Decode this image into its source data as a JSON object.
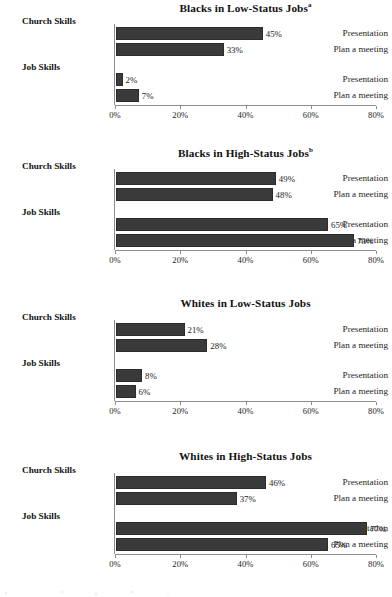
{
  "chart_data": [
    {
      "type": "bar",
      "orientation": "horizontal",
      "title": "Blacks in Low-Status Jobs",
      "title_superscript": "a",
      "xlabel": "",
      "ylabel": "",
      "xlim": [
        0,
        80
      ],
      "grid": false,
      "legend": "none",
      "tick_labels": [
        "0%",
        "20%",
        "40%",
        "60%",
        "80%"
      ],
      "tick_values": [
        0,
        20,
        40,
        60,
        80
      ],
      "groups": [
        {
          "name": "Church Skills",
          "categories": [
            "Presentation",
            "Plan a meeting"
          ],
          "values": [
            45,
            33
          ],
          "value_labels": [
            "45%",
            "33%"
          ]
        },
        {
          "name": "Job Skills",
          "categories": [
            "Presentation",
            "Plan a meeting"
          ],
          "values": [
            2,
            7
          ],
          "value_labels": [
            "2%",
            "7%"
          ]
        }
      ]
    },
    {
      "type": "bar",
      "orientation": "horizontal",
      "title": "Blacks in High-Status Jobs",
      "title_superscript": "b",
      "xlabel": "",
      "ylabel": "",
      "xlim": [
        0,
        80
      ],
      "grid": false,
      "legend": "none",
      "tick_labels": [
        "0%",
        "20%",
        "40%",
        "60%",
        "80%"
      ],
      "tick_values": [
        0,
        20,
        40,
        60,
        80
      ],
      "groups": [
        {
          "name": "Church Skills",
          "categories": [
            "Presentation",
            "Plan a meeting"
          ],
          "values": [
            49,
            48
          ],
          "value_labels": [
            "49%",
            "48%"
          ]
        },
        {
          "name": "Job Skills",
          "categories": [
            "Presentation",
            "Plan a meeting"
          ],
          "values": [
            65,
            73
          ],
          "value_labels": [
            "65%",
            "73%"
          ]
        }
      ]
    },
    {
      "type": "bar",
      "orientation": "horizontal",
      "title": "Whites in Low-Status Jobs",
      "title_superscript": "",
      "xlabel": "",
      "ylabel": "",
      "xlim": [
        0,
        80
      ],
      "grid": false,
      "legend": "none",
      "tick_labels": [
        "0%",
        "20%",
        "40%",
        "60%",
        "80%"
      ],
      "tick_values": [
        0,
        20,
        40,
        60,
        80
      ],
      "groups": [
        {
          "name": "Church Skills",
          "categories": [
            "Presentation",
            "Plan a meeting"
          ],
          "values": [
            21,
            28
          ],
          "value_labels": [
            "21%",
            "28%"
          ]
        },
        {
          "name": "Job Skills",
          "categories": [
            "Presentation",
            "Plan a meeting"
          ],
          "values": [
            8,
            6
          ],
          "value_labels": [
            "8%",
            "6%"
          ]
        }
      ]
    },
    {
      "type": "bar",
      "orientation": "horizontal",
      "title": "Whites in High-Status Jobs",
      "title_superscript": "",
      "xlabel": "",
      "ylabel": "",
      "xlim": [
        0,
        80
      ],
      "grid": false,
      "legend": "none",
      "tick_labels": [
        "0%",
        "20%",
        "40%",
        "60%",
        "80%"
      ],
      "tick_values": [
        0,
        20,
        40,
        60,
        80
      ],
      "groups": [
        {
          "name": "Church Skills",
          "categories": [
            "Presentation",
            "Plan a meeting"
          ],
          "values": [
            46,
            37
          ],
          "value_labels": [
            "46%",
            "37%"
          ]
        },
        {
          "name": "Job Skills",
          "categories": [
            "Presentation",
            "Plan a meeting"
          ],
          "values": [
            77,
            65
          ],
          "value_labels": [
            "77%",
            "65%"
          ]
        }
      ]
    }
  ],
  "style": {
    "bar_color": "#3a3a3a",
    "axis_color": "#8d8d8d",
    "text_color": "#1c1c1c",
    "background": "#ffffff"
  }
}
